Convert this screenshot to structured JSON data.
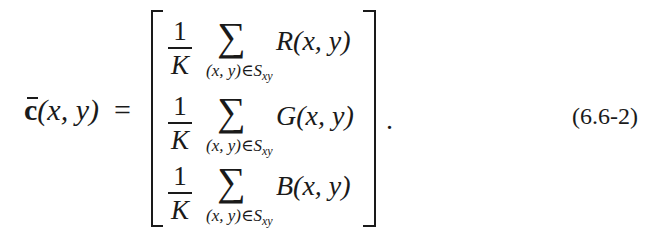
{
  "equation": {
    "lhs": {
      "symbol": "c",
      "accent": "bar",
      "args": "(x, y)",
      "equals": "="
    },
    "rows": [
      {
        "coefficient_numerator": "1",
        "coefficient_denominator": "K",
        "operator": "∑",
        "subscript_main": "(x, y)∈S",
        "subscript_index": "xy",
        "function_name": "R",
        "function_args": "(x, y)"
      },
      {
        "coefficient_numerator": "1",
        "coefficient_denominator": "K",
        "operator": "∑",
        "subscript_main": "(x, y)∈S",
        "subscript_index": "xy",
        "function_name": "G",
        "function_args": "(x, y)"
      },
      {
        "coefficient_numerator": "1",
        "coefficient_denominator": "K",
        "operator": "∑",
        "subscript_main": "(x, y)∈S",
        "subscript_index": "xy",
        "function_name": "B",
        "function_args": "(x, y)"
      }
    ],
    "terminator": ".",
    "number": "(6.6-2)"
  }
}
